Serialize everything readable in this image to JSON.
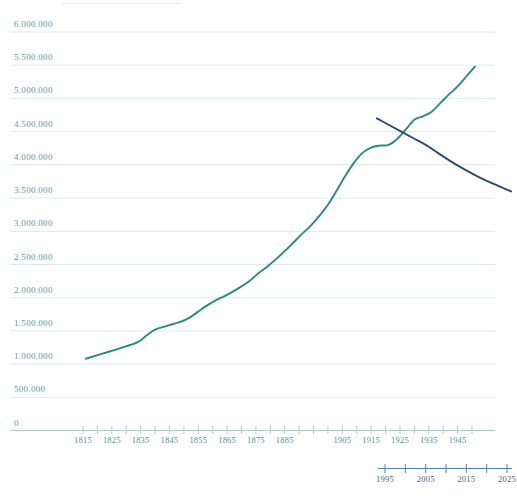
{
  "chart_data": {
    "type": "line",
    "title": "",
    "subtitle": "",
    "xlabel": "",
    "ylabel": "",
    "grid": true,
    "legend": "none",
    "y_axis": {
      "min": 0,
      "max": 6000000,
      "step": 500000,
      "thousands_separator": ".",
      "tick_labels": [
        "6.000.000",
        "5.500.000",
        "5.000.000",
        "4.500.000",
        "4.000.000",
        "3.500.000",
        "3.000.000",
        "2.500.000",
        "2.000.000",
        "1.500.000",
        "1.000.000",
        "500.000",
        "0"
      ],
      "tick_values": [
        6000000,
        5500000,
        5000000,
        4500000,
        4000000,
        3500000,
        3000000,
        2500000,
        2000000,
        1500000,
        1000000,
        500000,
        0
      ]
    },
    "x_axis_primary": {
      "min": 1810,
      "max": 1955,
      "tick_step": 5,
      "tick_labels": [
        "1815",
        "1825",
        "1835",
        "1845",
        "1855",
        "1865",
        "1875",
        "1885",
        "1905",
        "1915",
        "1925",
        "1935",
        "1945"
      ],
      "tick_label_years": [
        1815,
        1825,
        1835,
        1845,
        1855,
        1865,
        1875,
        1885,
        1905,
        1915,
        1925,
        1935,
        1945
      ]
    },
    "x_axis_secondary": {
      "min": 1990,
      "max": 2028,
      "tick_step": 5,
      "tick_labels": [
        "1995",
        "2005",
        "2015",
        "2025"
      ],
      "tick_label_years": [
        1995,
        2005,
        2015,
        2025
      ]
    },
    "series": [
      {
        "name": "historic-series",
        "color": "#2a8a80",
        "x": [
          1816,
          1822,
          1828,
          1834,
          1837,
          1840,
          1843,
          1846,
          1849,
          1852,
          1855,
          1858,
          1861,
          1864,
          1867,
          1870,
          1873,
          1876,
          1879,
          1882,
          1885,
          1888,
          1891,
          1894,
          1897,
          1900,
          1903,
          1906,
          1909,
          1912,
          1915,
          1918,
          1921,
          1924,
          1927,
          1930,
          1933,
          1936,
          1939,
          1942,
          1945,
          1948,
          1951
        ],
        "values": [
          1080000,
          1160000,
          1240000,
          1330000,
          1430000,
          1520000,
          1560000,
          1600000,
          1640000,
          1700000,
          1790000,
          1880000,
          1960000,
          2020000,
          2090000,
          2170000,
          2260000,
          2370000,
          2470000,
          2580000,
          2700000,
          2830000,
          2960000,
          3080000,
          3230000,
          3400000,
          3610000,
          3830000,
          4030000,
          4180000,
          4260000,
          4290000,
          4300000,
          4390000,
          4530000,
          4680000,
          4730000,
          4800000,
          4930000,
          5060000,
          5180000,
          5330000,
          5480000
        ]
      },
      {
        "name": "projection-series",
        "color": "#2c4a6e",
        "x": [
          1993,
          1996,
          1999,
          2002,
          2005,
          2008,
          2011,
          2014,
          2017,
          2020,
          2023,
          2026
        ],
        "values": [
          4700000,
          4600000,
          4500000,
          4400000,
          4300000,
          4180000,
          4060000,
          3950000,
          3850000,
          3760000,
          3680000,
          3600000
        ]
      }
    ]
  },
  "axis_colors": {
    "grid": "#d9eceb",
    "axis_line": "#a9cfcd",
    "y_label": "#5b9aa0",
    "x_label_primary": "#4f9096",
    "x_label_secondary": "#3d5f82",
    "secondary_axis_line": "#5a7fa3"
  }
}
